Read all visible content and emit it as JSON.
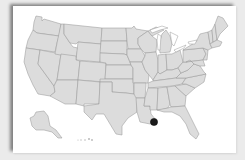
{
  "map": {
    "region": "United States",
    "fill_color": "#dcdcdc",
    "border_color": "#9a9a9a",
    "background": "#ffffff",
    "frame_background": "#ebebeb",
    "marker": {
      "location": "Southeast Louisiana",
      "color": "#1a1a1a",
      "cx": 154,
      "cy": 122,
      "r": 3.6
    },
    "inset_label": "‘ Uni pr"
  }
}
